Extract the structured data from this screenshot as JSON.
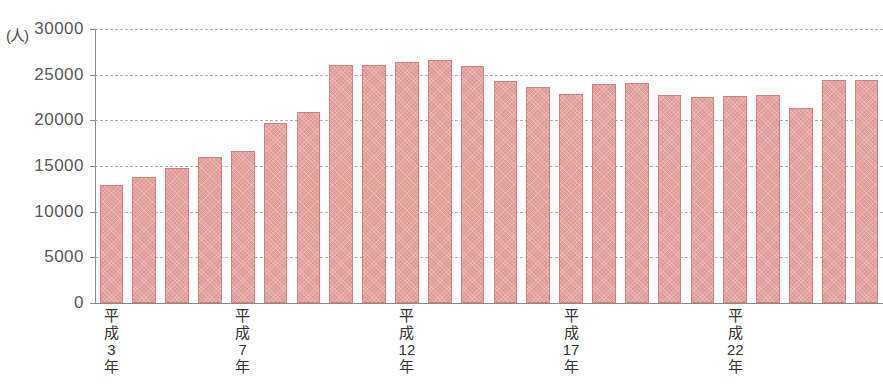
{
  "chart_data": {
    "type": "bar",
    "title": "",
    "subtitle": "",
    "xlabel": "",
    "ylabel": "",
    "unit_label": "(人)",
    "ylim": [
      0,
      30000
    ],
    "ytick_labels": [
      "30000",
      "25000",
      "20000",
      "15000",
      "10000",
      "5000",
      "0"
    ],
    "ytick_values": [
      30000,
      25000,
      20000,
      15000,
      10000,
      5000,
      0
    ],
    "grid": true,
    "grid_style": "dashed-horizontal",
    "legend": null,
    "bar_color": "#e09a96",
    "bar_border_color": "#d2817d",
    "categories": [
      "平成3年",
      "平成4年",
      "平成5年",
      "平成6年",
      "平成7年",
      "平成8年",
      "平成9年",
      "平成10年",
      "平成11年",
      "平成12年",
      "平成13年",
      "平成14年",
      "平成15年",
      "平成16年",
      "平成17年",
      "平成18年",
      "平成19年",
      "平成20年",
      "平成21年",
      "平成22年",
      "平成23年",
      "平成24年",
      "平成25年",
      "平成26年"
    ],
    "values": [
      12900,
      13800,
      14800,
      16000,
      16600,
      19700,
      20900,
      26100,
      26100,
      26400,
      26600,
      25900,
      24300,
      23600,
      22900,
      24000,
      24100,
      22800,
      22600,
      22700,
      22800,
      21400,
      24400,
      24400
    ],
    "visible_xtick_labels": [
      {
        "index": 0,
        "lines": [
          "平",
          "成",
          "3",
          "年"
        ]
      },
      {
        "index": 4,
        "lines": [
          "平",
          "成",
          "7",
          "年"
        ]
      },
      {
        "index": 9,
        "lines": [
          "平",
          "成",
          "12",
          "年"
        ]
      },
      {
        "index": 14,
        "lines": [
          "平",
          "成",
          "17",
          "年"
        ]
      },
      {
        "index": 19,
        "lines": [
          "平",
          "成",
          "22",
          "年"
        ]
      }
    ]
  }
}
